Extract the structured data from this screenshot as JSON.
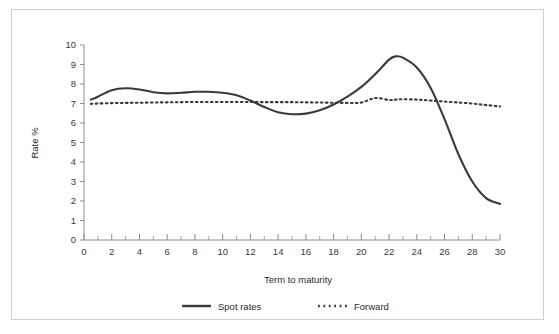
{
  "figure": {
    "background_color": "#ffffff",
    "border_color": "#cfcfcf",
    "line_color": "#3a3a3a",
    "axis_color": "#8c8c8c"
  },
  "chart_data": {
    "type": "line",
    "title": "",
    "xlabel": "Term to maturity",
    "ylabel": "Rate %",
    "xlim": [
      0,
      30
    ],
    "ylim": [
      0,
      10
    ],
    "grid": false,
    "legend_position": "bottom",
    "x_ticks": [
      0,
      2,
      4,
      6,
      8,
      10,
      12,
      14,
      16,
      18,
      20,
      22,
      24,
      26,
      28,
      30
    ],
    "x_tick_labels": [
      "0",
      "2",
      "4",
      "6",
      "8",
      "10",
      "12",
      "14",
      "16",
      "18",
      "20",
      "22",
      "24",
      "26",
      "28",
      "30"
    ],
    "x_minor_tick_step": 1,
    "y_ticks": [
      0,
      1,
      2,
      3,
      4,
      5,
      6,
      7,
      8,
      9,
      10
    ],
    "y_tick_labels": [
      "0",
      "1",
      "2",
      "3",
      "4",
      "5",
      "6",
      "7",
      "8",
      "9",
      "10"
    ],
    "x": [
      0.5,
      1,
      2,
      3,
      4,
      5,
      6,
      7,
      8,
      9,
      10,
      11,
      12,
      13,
      14,
      15,
      16,
      17,
      18,
      19,
      20,
      21,
      22,
      22.5,
      23,
      24,
      25,
      26,
      27,
      28,
      29,
      30
    ],
    "series": [
      {
        "name": "Spot rates",
        "style": "solid",
        "values": [
          7.2,
          7.35,
          7.68,
          7.78,
          7.72,
          7.58,
          7.52,
          7.55,
          7.6,
          7.6,
          7.55,
          7.42,
          7.15,
          6.82,
          6.55,
          6.45,
          6.48,
          6.65,
          6.95,
          7.35,
          7.85,
          8.5,
          9.25,
          9.42,
          9.35,
          8.85,
          7.8,
          6.2,
          4.4,
          3.0,
          2.15,
          1.85
        ]
      },
      {
        "name": "Forward",
        "style": "dotted",
        "values": [
          6.98,
          7.0,
          7.02,
          7.03,
          7.04,
          7.05,
          7.06,
          7.07,
          7.08,
          7.08,
          7.08,
          7.08,
          7.08,
          7.07,
          7.07,
          7.07,
          7.06,
          7.05,
          7.04,
          7.03,
          7.05,
          7.28,
          7.18,
          7.2,
          7.22,
          7.2,
          7.15,
          7.1,
          7.05,
          7.0,
          6.92,
          6.85
        ]
      }
    ],
    "legend": [
      {
        "label": "Spot rates",
        "style": "solid"
      },
      {
        "label": "Forward",
        "style": "dotted"
      }
    ]
  }
}
